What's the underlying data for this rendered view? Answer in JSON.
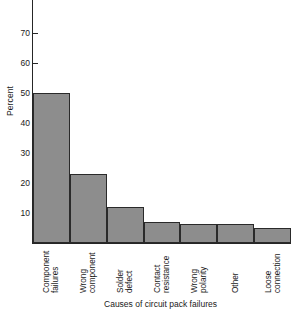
{
  "chart_data": {
    "type": "bar",
    "title": "",
    "xlabel": "Causes of circuit pack failures",
    "ylabel": "Percent",
    "categories": [
      "Component failures",
      "Wrong component",
      "Solder defect",
      "Contact resistance",
      "Wrong polarity",
      "Other",
      "Loose connection"
    ],
    "category_lines": [
      [
        "Component",
        "failures"
      ],
      [
        "Wrong",
        "component"
      ],
      [
        "Solder",
        "defect"
      ],
      [
        "Contact",
        "resistance"
      ],
      [
        "Wrong",
        "polarity"
      ],
      [
        "Other",
        ""
      ],
      [
        "Loose",
        "connection"
      ]
    ],
    "values": [
      50,
      23,
      12,
      7,
      6.5,
      6.5,
      5
    ],
    "ylim": [
      0,
      78
    ],
    "yticks": [
      10,
      20,
      30,
      40,
      50,
      60,
      70
    ],
    "ytick_labels": [
      "10",
      "20",
      "30",
      "40",
      "50",
      "60",
      "70"
    ],
    "grid": false,
    "legend": null,
    "bar_color": "#8d8d8d",
    "bar_edge_color": "#2a2a2a",
    "axis_color": "#262626",
    "background_color": "#ffffff"
  },
  "axes": {
    "y_label": "Percent",
    "x_label": "Causes of circuit pack failures"
  }
}
